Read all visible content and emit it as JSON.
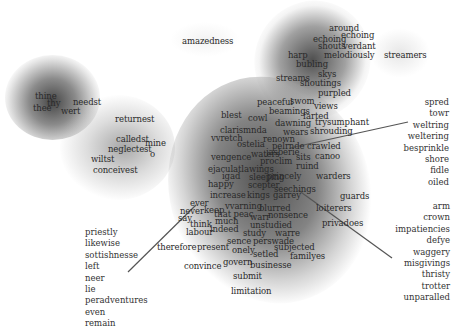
{
  "diagram": {
    "type": "word-embedding-density-map",
    "clusters": [
      {
        "name": "top-left",
        "words": [
          {
            "t": "thine",
            "x": 35,
            "y": 92
          },
          {
            "t": "thy",
            "x": 47,
            "y": 99
          },
          {
            "t": "needst",
            "x": 73,
            "y": 98
          },
          {
            "t": "thee",
            "x": 33,
            "y": 104
          },
          {
            "t": "wert",
            "x": 61,
            "y": 107
          }
        ]
      },
      {
        "name": "left-middle",
        "words": [
          {
            "t": "returnest",
            "x": 115,
            "y": 115
          },
          {
            "t": "calledst",
            "x": 116,
            "y": 135
          },
          {
            "t": "mine",
            "x": 145,
            "y": 139
          },
          {
            "t": "neglectest",
            "x": 108,
            "y": 145
          },
          {
            "t": "o",
            "x": 150,
            "y": 150
          },
          {
            "t": "wiltst",
            "x": 91,
            "y": 155
          },
          {
            "t": "conceivest",
            "x": 93,
            "y": 166
          }
        ]
      },
      {
        "name": "top",
        "words": [
          {
            "t": "amazedness",
            "x": 182,
            "y": 37
          },
          {
            "t": "around",
            "x": 329,
            "y": 24
          },
          {
            "t": "echoing",
            "x": 341,
            "y": 31
          },
          {
            "t": "echoing",
            "x": 313,
            "y": 35
          },
          {
            "t": "shouts",
            "x": 318,
            "y": 42
          },
          {
            "t": "verdant",
            "x": 343,
            "y": 42
          },
          {
            "t": "harp",
            "x": 288,
            "y": 51
          },
          {
            "t": "melodiously",
            "x": 324,
            "y": 51
          },
          {
            "t": "streamers",
            "x": 384,
            "y": 51
          },
          {
            "t": "bubling",
            "x": 296,
            "y": 60
          },
          {
            "t": "skys",
            "x": 318,
            "y": 70
          },
          {
            "t": "streams",
            "x": 276,
            "y": 74
          },
          {
            "t": "shoutings",
            "x": 300,
            "y": 79
          },
          {
            "t": "purpled",
            "x": 318,
            "y": 89
          }
        ]
      },
      {
        "name": "center",
        "words": [
          {
            "t": "peaceful",
            "x": 257,
            "y": 98
          },
          {
            "t": "swom",
            "x": 290,
            "y": 97
          },
          {
            "t": "views",
            "x": 314,
            "y": 102
          },
          {
            "t": "blest",
            "x": 221,
            "y": 111
          },
          {
            "t": "cowl",
            "x": 248,
            "y": 114
          },
          {
            "t": "beamings",
            "x": 269,
            "y": 107
          },
          {
            "t": "farted",
            "x": 303,
            "y": 112
          },
          {
            "t": "trysumphant",
            "x": 315,
            "y": 118
          },
          {
            "t": "dawning",
            "x": 275,
            "y": 119
          },
          {
            "t": "clarismnda",
            "x": 220,
            "y": 126
          },
          {
            "t": "wears",
            "x": 283,
            "y": 128
          },
          {
            "t": "shrouding",
            "x": 310,
            "y": 127
          },
          {
            "t": "vvretch",
            "x": 211,
            "y": 134
          },
          {
            "t": "ostelia",
            "x": 237,
            "y": 140
          },
          {
            "t": "renown",
            "x": 263,
            "y": 135
          },
          {
            "t": "pelrnde",
            "x": 272,
            "y": 142
          },
          {
            "t": "crawled",
            "x": 307,
            "y": 142
          },
          {
            "t": "jasberie",
            "x": 266,
            "y": 148
          },
          {
            "t": "vengence",
            "x": 211,
            "y": 153
          },
          {
            "t": "waters",
            "x": 251,
            "y": 150
          },
          {
            "t": "proclim",
            "x": 260,
            "y": 157
          },
          {
            "t": "sits",
            "x": 296,
            "y": 153
          },
          {
            "t": "canoo",
            "x": 315,
            "y": 152
          },
          {
            "t": "ruind",
            "x": 296,
            "y": 162
          },
          {
            "t": "ejaculatlawings",
            "x": 208,
            "y": 165
          },
          {
            "t": "princely",
            "x": 267,
            "y": 172
          },
          {
            "t": "warders",
            "x": 316,
            "y": 172
          },
          {
            "t": "igad",
            "x": 222,
            "y": 172
          },
          {
            "t": "sleeping",
            "x": 249,
            "y": 173
          },
          {
            "t": "happy",
            "x": 208,
            "y": 180
          },
          {
            "t": "scepter",
            "x": 248,
            "y": 181
          },
          {
            "t": "seechings",
            "x": 274,
            "y": 185
          },
          {
            "t": "increase",
            "x": 210,
            "y": 191
          },
          {
            "t": "kings",
            "x": 247,
            "y": 191
          },
          {
            "t": "garrey",
            "x": 273,
            "y": 191
          },
          {
            "t": "guards",
            "x": 340,
            "y": 192
          },
          {
            "t": "ever",
            "x": 190,
            "y": 199
          },
          {
            "t": "keep",
            "x": 204,
            "y": 206
          },
          {
            "t": "vvarning",
            "x": 225,
            "y": 202
          },
          {
            "t": "blurred",
            "x": 259,
            "y": 204
          },
          {
            "t": "loiterers",
            "x": 316,
            "y": 204
          },
          {
            "t": "never",
            "x": 180,
            "y": 207
          },
          {
            "t": "that peac",
            "x": 214,
            "y": 210
          },
          {
            "t": "warr",
            "x": 250,
            "y": 213
          },
          {
            "t": "nonsence",
            "x": 268,
            "y": 211
          },
          {
            "t": "say",
            "x": 178,
            "y": 214
          },
          {
            "t": "think",
            "x": 190,
            "y": 220
          },
          {
            "t": "much",
            "x": 215,
            "y": 217
          },
          {
            "t": "unstudied",
            "x": 250,
            "y": 221
          },
          {
            "t": "privadoes",
            "x": 322,
            "y": 219
          },
          {
            "t": "labour",
            "x": 186,
            "y": 228
          },
          {
            "t": "indeed",
            "x": 210,
            "y": 225
          },
          {
            "t": "study",
            "x": 243,
            "y": 229
          },
          {
            "t": "warre",
            "x": 275,
            "y": 229
          },
          {
            "t": "sence",
            "x": 227,
            "y": 237
          },
          {
            "t": "perswade",
            "x": 253,
            "y": 237
          },
          {
            "t": "therefore",
            "x": 157,
            "y": 243
          },
          {
            "t": "present",
            "x": 197,
            "y": 243
          },
          {
            "t": "onely",
            "x": 232,
            "y": 246
          },
          {
            "t": "setled",
            "x": 253,
            "y": 250
          },
          {
            "t": "subjected",
            "x": 274,
            "y": 243
          },
          {
            "t": "familyes",
            "x": 290,
            "y": 252
          },
          {
            "t": "convince",
            "x": 184,
            "y": 262
          },
          {
            "t": "govern",
            "x": 223,
            "y": 258
          },
          {
            "t": "businesse",
            "x": 250,
            "y": 261
          },
          {
            "t": "submit",
            "x": 233,
            "y": 272
          },
          {
            "t": "limitation",
            "x": 231,
            "y": 287
          }
        ]
      }
    ],
    "lists": {
      "right_top": [
        "spred",
        "towr",
        "weltring",
        "weltering",
        "besprinkle",
        "shore",
        "fidle",
        "oiled"
      ],
      "right_bottom": [
        "arm",
        "crown",
        "impatiencies",
        "defye",
        "waggery",
        "misgivings",
        "thristy",
        "trotter",
        "unparalled"
      ],
      "left_bottom": [
        "priestly",
        "likewise",
        "sottishnesse",
        "left",
        "neer",
        "lie",
        "peradventures",
        "even",
        "remain"
      ]
    },
    "colors": {
      "background": "#ffffff",
      "text": "#2a2a2a",
      "density": "#4a4a4a",
      "leader_line": "#555555"
    }
  }
}
